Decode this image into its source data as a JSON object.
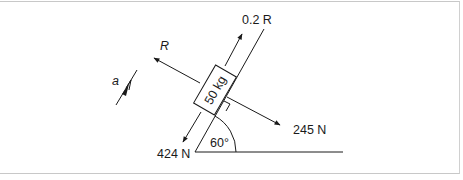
{
  "diagram": {
    "block_label": "50 kg",
    "incline_angle_label": "60°",
    "forces": {
      "reaction": "R",
      "friction": "0.2 R",
      "weight_component_parallel": "424 N",
      "weight_component_normal": "245 N"
    },
    "acceleration_label": "a",
    "colors": {
      "line": "#1a1a1a",
      "frame": "#c8c8c8"
    }
  }
}
